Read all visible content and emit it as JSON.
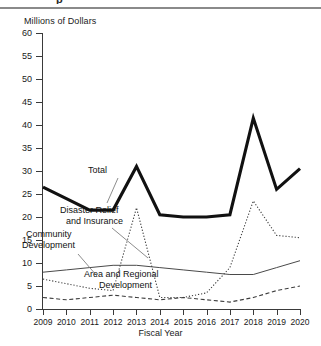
{
  "figure": {
    "cut_off_heading": "p",
    "y_axis_title": "Millions of Dollars",
    "x_axis_title": "Fiscal Year"
  },
  "annotations": {
    "total": "Total",
    "disaster_line1": "Disaster Relief",
    "disaster_line2": "and Insurance",
    "community_line1": "Community",
    "community_line2": "Development",
    "area_line1": "Area and Regional",
    "area_line2": "Development"
  },
  "chart_data": {
    "type": "line",
    "title": "",
    "xlabel": "Fiscal Year",
    "ylabel": "Millions of Dollars",
    "ylim": [
      0,
      60
    ],
    "ytick_step": 5,
    "yticks": [
      0,
      5,
      10,
      15,
      20,
      25,
      30,
      35,
      40,
      45,
      50,
      55,
      60
    ],
    "grid": false,
    "legend": "inline-labels",
    "categories": [
      "2009",
      "2010",
      "2011",
      "2012",
      "2013",
      "2014",
      "2015",
      "2016",
      "2017",
      "2018",
      "2019",
      "2020"
    ],
    "series": [
      {
        "name": "Total",
        "style": "thick-solid",
        "color": "#111111",
        "values": [
          26.5,
          24.0,
          21.5,
          21.5,
          31.0,
          20.5,
          20.0,
          20.0,
          20.5,
          41.5,
          26.0,
          30.5
        ]
      },
      {
        "name": "Disaster Relief and Insurance",
        "style": "fine-dotted",
        "color": "#3d3d3d",
        "values": [
          6.5,
          5.5,
          4.5,
          4.0,
          22.0,
          2.5,
          2.5,
          3.5,
          9.0,
          23.5,
          16.0,
          15.5
        ]
      },
      {
        "name": "Community Development",
        "style": "thin-solid",
        "color": "#4a4a4a",
        "values": [
          8.0,
          8.5,
          9.0,
          9.5,
          9.5,
          9.0,
          8.5,
          8.0,
          7.5,
          7.5,
          9.0,
          10.5
        ]
      },
      {
        "name": "Area and Regional Development",
        "style": "dashed",
        "color": "#3d3d3d",
        "values": [
          2.5,
          2.0,
          2.5,
          3.0,
          2.5,
          2.0,
          2.5,
          2.0,
          1.5,
          2.5,
          4.0,
          5.0
        ]
      }
    ]
  }
}
